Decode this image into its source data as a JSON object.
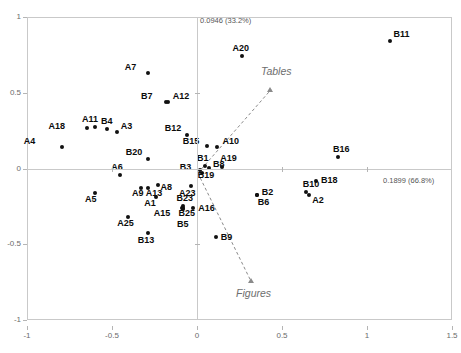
{
  "chart_data": {
    "type": "scatter",
    "title": "",
    "xlabel": "0.1899 (66.8%)",
    "ylabel": "0.0946 (33.2%)",
    "xlim": [
      -1,
      1.5
    ],
    "ylim": [
      -1,
      1
    ],
    "xticks": [
      "-1",
      "-0.5",
      "0",
      "0.5",
      "1",
      "1.5"
    ],
    "xtick_values": [
      -1,
      -0.5,
      0,
      0.5,
      1,
      1.5
    ],
    "yticks": [
      "1",
      "0.5",
      "0",
      "-0.5",
      "-1"
    ],
    "ytick_values": [
      1,
      0.5,
      0,
      -0.5,
      -1
    ],
    "grid": false,
    "legend": "none",
    "axis_note_x": "0.1899 (66.8%)",
    "axis_note_y": "0.0946 (33.2%)",
    "points": [
      {
        "label": "A4",
        "x": -0.795,
        "y": 0.143,
        "lx": -38,
        "ly": -10
      },
      {
        "label": "A18",
        "x": -0.65,
        "y": 0.265,
        "lx": -38,
        "ly": -6
      },
      {
        "label": "A11",
        "x": -0.6,
        "y": 0.272,
        "lx": -13,
        "ly": -12
      },
      {
        "label": "B4",
        "x": -0.53,
        "y": 0.258,
        "lx": -6,
        "ly": -12
      },
      {
        "label": "A3",
        "x": -0.472,
        "y": 0.243,
        "lx": 4,
        "ly": -10
      },
      {
        "label": "A7",
        "x": -0.29,
        "y": 0.628,
        "lx": -23,
        "ly": -10
      },
      {
        "label": "B7",
        "x": -0.182,
        "y": 0.436,
        "lx": -25,
        "ly": -10
      },
      {
        "label": "A12",
        "x": -0.172,
        "y": 0.436,
        "lx": 5,
        "ly": -10
      },
      {
        "label": "B20",
        "x": -0.29,
        "y": 0.066,
        "lx": -22,
        "ly": -11
      },
      {
        "label": "B12",
        "x": -0.06,
        "y": 0.218,
        "lx": -22,
        "ly": -11
      },
      {
        "label": "B15",
        "x": 0.057,
        "y": 0.148,
        "lx": -24,
        "ly": -9
      },
      {
        "label": "A10",
        "x": 0.12,
        "y": 0.14,
        "lx": 5,
        "ly": -10
      },
      {
        "label": "A20",
        "x": 0.262,
        "y": 0.74,
        "lx": -9,
        "ly": -12
      },
      {
        "label": "B11",
        "x": 1.133,
        "y": 0.842,
        "lx": 4,
        "ly": -11
      },
      {
        "label": "B16",
        "x": 0.83,
        "y": 0.073,
        "lx": -5,
        "ly": -12
      },
      {
        "label": "B1",
        "x": 0.047,
        "y": 0.018,
        "lx": -8,
        "ly": -12
      },
      {
        "label": "B8",
        "x": 0.07,
        "y": 0.005,
        "lx": 4,
        "ly": -8
      },
      {
        "label": "B3",
        "x": 0.016,
        "y": -0.01,
        "lx": -20,
        "ly": -7
      },
      {
        "label": "B19",
        "x": 0.028,
        "y": -0.028,
        "lx": -4,
        "ly": -2
      },
      {
        "label": "A19",
        "x": 0.148,
        "y": 0.01,
        "lx": -2,
        "ly": -13
      },
      {
        "label": "B18",
        "x": 0.7,
        "y": -0.08,
        "lx": 5,
        "ly": -5
      },
      {
        "label": "B10",
        "x": 0.64,
        "y": -0.155,
        "lx": -3,
        "ly": -12
      },
      {
        "label": "A2",
        "x": 0.66,
        "y": -0.178,
        "lx": 3,
        "ly": 1
      },
      {
        "label": "B2",
        "x": 0.352,
        "y": -0.173,
        "lx": 5,
        "ly": -7
      },
      {
        "label": "B6",
        "x": 0.352,
        "y": -0.178,
        "lx": 1,
        "ly": 3
      },
      {
        "label": "A6",
        "x": -0.452,
        "y": -0.042,
        "lx": -9,
        "ly": -12
      },
      {
        "label": "A9",
        "x": -0.33,
        "y": -0.128,
        "lx": -9,
        "ly": 1
      },
      {
        "label": "A13",
        "x": -0.29,
        "y": -0.128,
        "lx": -2,
        "ly": 1
      },
      {
        "label": "A8",
        "x": -0.232,
        "y": -0.112,
        "lx": 3,
        "ly": -2
      },
      {
        "label": "A5",
        "x": -0.6,
        "y": -0.16,
        "lx": -10,
        "ly": 2
      },
      {
        "label": "A1",
        "x": -0.24,
        "y": -0.19,
        "lx": -12,
        "ly": 2
      },
      {
        "label": "A25",
        "x": -0.405,
        "y": -0.322,
        "lx": -11,
        "ly": 2
      },
      {
        "label": "B13",
        "x": -0.29,
        "y": -0.425,
        "lx": -10,
        "ly": 3
      },
      {
        "label": "B23",
        "x": -0.085,
        "y": -0.245,
        "lx": -6,
        "ly": -12
      },
      {
        "label": "A15",
        "x": -0.09,
        "y": -0.26,
        "lx": -28,
        "ly": 1
      },
      {
        "label": "B25",
        "x": -0.08,
        "y": -0.262,
        "lx": -5,
        "ly": 1
      },
      {
        "label": "B5",
        "x": -0.082,
        "y": -0.268,
        "lx": -6,
        "ly": 11
      },
      {
        "label": "A16",
        "x": -0.022,
        "y": -0.262,
        "lx": 5,
        "ly": -4
      },
      {
        "label": "A23",
        "x": -0.035,
        "y": -0.118,
        "lx": -12,
        "ly": 3
      },
      {
        "label": "B9",
        "x": 0.11,
        "y": -0.45,
        "lx": 5,
        "ly": -4
      }
    ],
    "vectors": [
      {
        "label": "Tables",
        "x": 0.435,
        "y": 0.52,
        "origin_x": 0.005,
        "origin_y": -0.03,
        "lx": -10,
        "ly": -24
      },
      {
        "label": "Figures",
        "x": 0.318,
        "y": -0.745,
        "origin_x": 0.005,
        "origin_y": -0.03,
        "lx": -15,
        "ly": 7
      }
    ]
  }
}
